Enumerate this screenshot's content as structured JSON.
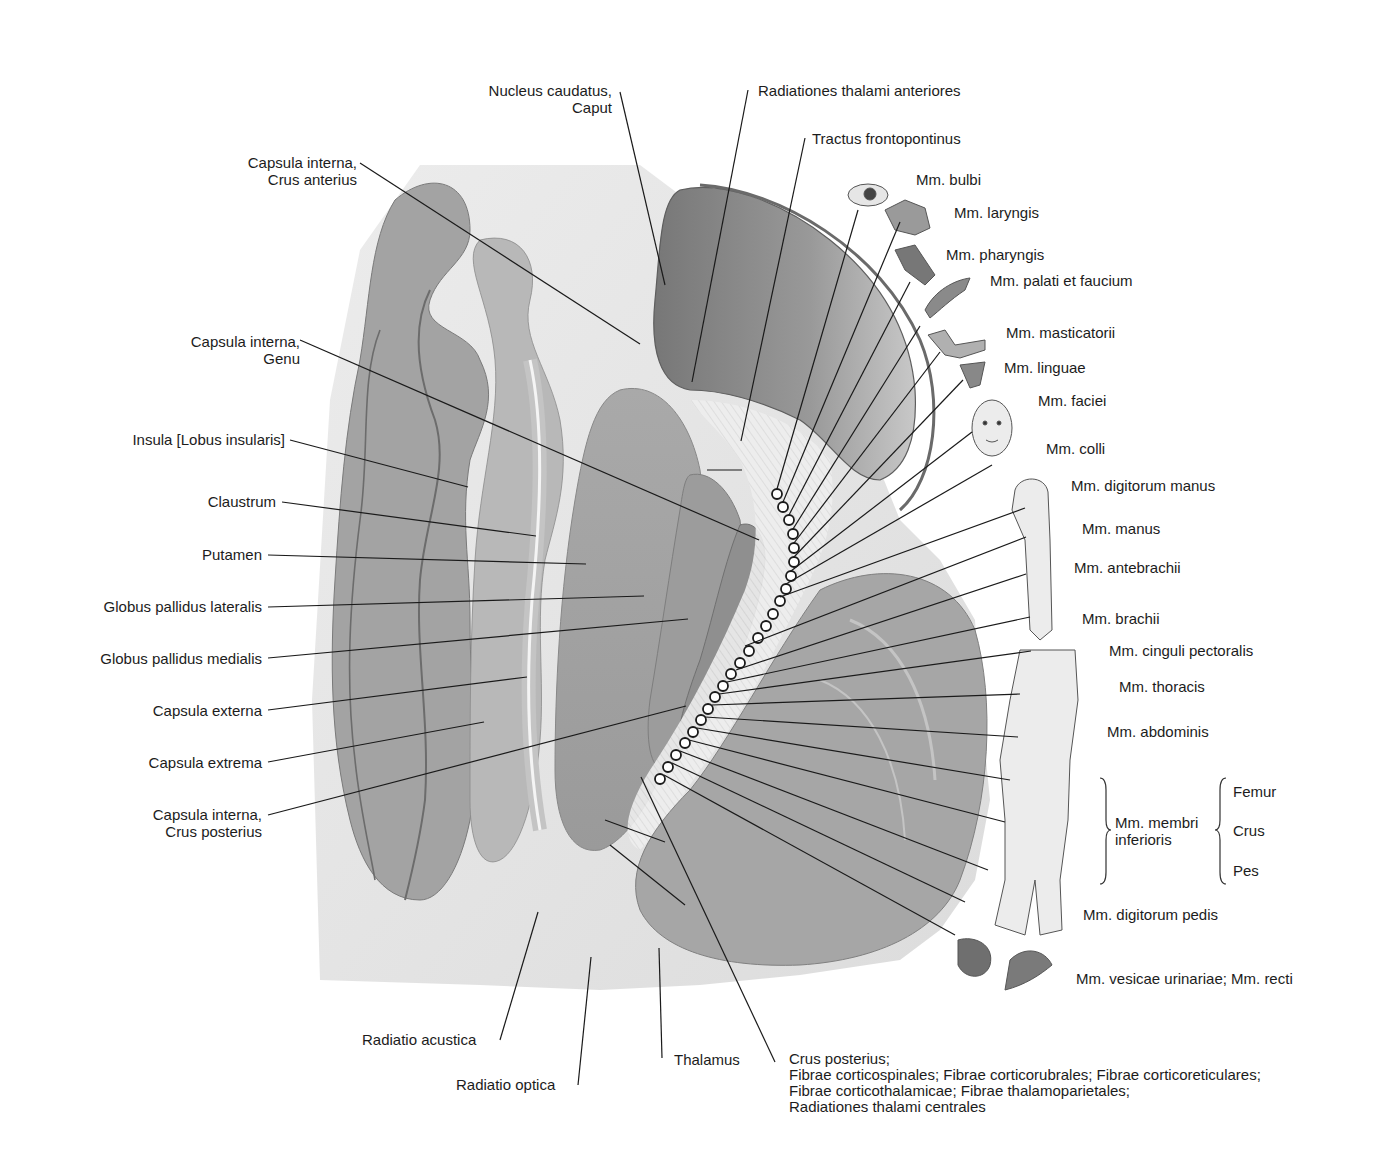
{
  "labels_left": [
    {
      "id": "nucleus-caudatus-caput",
      "text": "Nucleus caudatus,\nCaput"
    },
    {
      "id": "capsula-interna-crus-anterius",
      "text": "Capsula interna,\nCrus anterius"
    },
    {
      "id": "capsula-interna-genu",
      "text": "Capsula interna,\nGenu"
    },
    {
      "id": "insula",
      "text": "Insula [Lobus insularis]"
    },
    {
      "id": "claustrum",
      "text": "Claustrum"
    },
    {
      "id": "putamen",
      "text": "Putamen"
    },
    {
      "id": "globus-pallidus-lateralis",
      "text": "Globus pallidus lateralis"
    },
    {
      "id": "globus-pallidus-medialis",
      "text": "Globus pallidus medialis"
    },
    {
      "id": "capsula-externa",
      "text": "Capsula externa"
    },
    {
      "id": "capsula-extrema",
      "text": "Capsula extrema"
    },
    {
      "id": "capsula-interna-crus-posterius",
      "text": "Capsula interna,\nCrus posterius"
    }
  ],
  "labels_top": [
    {
      "id": "radiationes-thalami-anteriores",
      "text": "Radiationes thalami anteriores"
    },
    {
      "id": "tractus-frontopontinus",
      "text": "Tractus frontopontinus"
    }
  ],
  "labels_right": [
    {
      "id": "mm-bulbi",
      "text": "Mm. bulbi"
    },
    {
      "id": "mm-laryngis",
      "text": "Mm. laryngis"
    },
    {
      "id": "mm-pharyngis",
      "text": "Mm. pharyngis"
    },
    {
      "id": "mm-palati-et-faucium",
      "text": "Mm. palati et faucium"
    },
    {
      "id": "mm-masticatorii",
      "text": "Mm. masticatorii"
    },
    {
      "id": "mm-linguae",
      "text": "Mm. linguae"
    },
    {
      "id": "mm-faciei",
      "text": "Mm. faciei"
    },
    {
      "id": "mm-colli",
      "text": "Mm. colli"
    },
    {
      "id": "mm-digitorum-manus",
      "text": "Mm. digitorum manus"
    },
    {
      "id": "mm-manus",
      "text": "Mm. manus"
    },
    {
      "id": "mm-antebrachii",
      "text": "Mm. antebrachii"
    },
    {
      "id": "mm-brachii",
      "text": "Mm. brachii"
    },
    {
      "id": "mm-cinguli-pectoralis",
      "text": "Mm. cinguli pectoralis"
    },
    {
      "id": "mm-thoracis",
      "text": "Mm. thoracis"
    },
    {
      "id": "mm-abdominis",
      "text": "Mm. abdominis"
    },
    {
      "id": "mm-membri-inferioris",
      "text": "Mm. membri\ninferioris"
    },
    {
      "id": "femur",
      "text": "Femur"
    },
    {
      "id": "crus",
      "text": "Crus"
    },
    {
      "id": "pes",
      "text": "Pes"
    },
    {
      "id": "mm-digitorum-pedis",
      "text": "Mm. digitorum pedis"
    },
    {
      "id": "mm-vesicae-recti",
      "text": "Mm. vesicae urinariae; Mm. recti"
    }
  ],
  "labels_bottom": [
    {
      "id": "radiatio-acustica",
      "text": "Radiatio acustica"
    },
    {
      "id": "radiatio-optica",
      "text": "Radiatio optica"
    },
    {
      "id": "thalamus",
      "text": "Thalamus"
    },
    {
      "id": "crus-posterius-fibres",
      "text": "Crus posterius;\nFibrae corticospinales; Fibrae corticorubrales; Fibrae corticoreticulares;\nFibrae corticothalamicae; Fibrae thalamoparietales;\nRadiationes thalami centrales"
    }
  ],
  "colors": {
    "background": "#ffffff",
    "grey_matter_dark": "#8e8e8e",
    "grey_matter_mid": "#b0b0b0",
    "white_matter": "#e4e4e4",
    "leader_line": "#1a1a1a"
  }
}
